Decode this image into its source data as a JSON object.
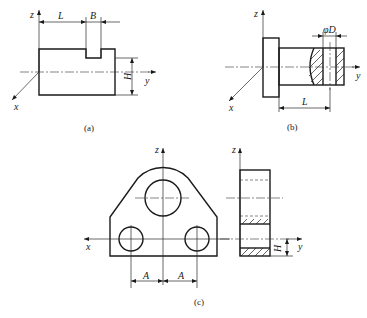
{
  "figure_a": {
    "caption": "(a)",
    "axes": {
      "z": "z",
      "y": "y",
      "x": "x"
    },
    "dimensions": {
      "length": "L",
      "width": "B",
      "height": "H"
    }
  },
  "figure_b": {
    "caption": "(b)",
    "axes": {
      "z": "z",
      "y": "y",
      "x": "x"
    },
    "dimensions": {
      "diameter": "φD",
      "length": "L"
    }
  },
  "figure_c": {
    "caption": "(c)",
    "front_view_axes": {
      "z": "z",
      "x": "x"
    },
    "side_view_axes": {
      "z": "z",
      "y": "y"
    },
    "dimensions": {
      "offset_left": "A",
      "offset_right": "A",
      "height": "H"
    }
  }
}
